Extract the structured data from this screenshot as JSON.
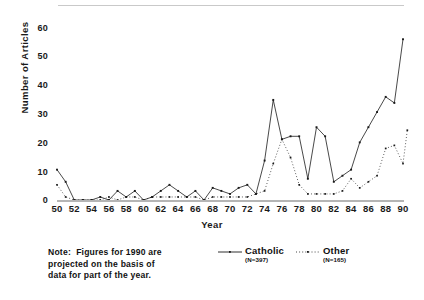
{
  "chart_data": {
    "type": "line",
    "title": "",
    "xlabel": "Year",
    "ylabel": "Number of Articles",
    "xlim": [
      50,
      90
    ],
    "ylim": [
      0,
      60
    ],
    "grid": false,
    "legend_position": "below-plot-right",
    "x": [
      50,
      51,
      52,
      53,
      54,
      55,
      56,
      57,
      58,
      59,
      60,
      61,
      62,
      63,
      64,
      65,
      66,
      67,
      68,
      69,
      70,
      71,
      72,
      73,
      74,
      75,
      76,
      77,
      78,
      79,
      80,
      81,
      82,
      83,
      84,
      85,
      86,
      87,
      88,
      89,
      90
    ],
    "xtick_labels": [
      "50",
      "52",
      "54",
      "56",
      "58",
      "60",
      "62",
      "64",
      "66",
      "68",
      "70",
      "72",
      "74",
      "76",
      "78",
      "80",
      "82",
      "84",
      "86",
      "88",
      "90"
    ],
    "xtick_values": [
      50,
      52,
      54,
      56,
      58,
      60,
      62,
      64,
      66,
      68,
      70,
      72,
      74,
      76,
      78,
      80,
      82,
      84,
      86,
      88,
      90
    ],
    "ytick_labels": [
      "0",
      "10",
      "20",
      "30",
      "40",
      "50",
      "60"
    ],
    "ytick_values": [
      0,
      10,
      20,
      30,
      40,
      50,
      60
    ],
    "series": [
      {
        "name": "Catholic",
        "n_label": "(N=397)",
        "marker": "dot",
        "line_style": "solid",
        "color": "#1a1a1a",
        "values": [
          10,
          6,
          0,
          0,
          1,
          1,
          2,
          4,
          1,
          4,
          1,
          2,
          4,
          6,
          3,
          2,
          4,
          1,
          5,
          4,
          3,
          4,
          3,
          4,
          6,
          6,
          4,
          4,
          4,
          3,
          3,
          3,
          2,
          1,
          1,
          1,
          1,
          1,
          1,
          1,
          1
        ]
      },
      {
        "name": "Other",
        "n_label": "(N=165)",
        "marker": "dot",
        "line_style": "dotted",
        "color": "#1a1a1a",
        "values": [
          5,
          1,
          0,
          0,
          0,
          1,
          0,
          1,
          0,
          1,
          0,
          1,
          1,
          1,
          1,
          1,
          1,
          1,
          1,
          1,
          1,
          1,
          1,
          1,
          2,
          12,
          20,
          15,
          2,
          2,
          2,
          2,
          2,
          3,
          3,
          5,
          7,
          9,
          10,
          6,
          11
        ]
      }
    ],
    "catholic_values": [
      10,
      6,
      0,
      0,
      1,
      1,
      2,
      4,
      1,
      4,
      1,
      2,
      4,
      6,
      3,
      2,
      4,
      1,
      5,
      4,
      3,
      4,
      3,
      4,
      6,
      33,
      20,
      21,
      9,
      4,
      12,
      11,
      4,
      5,
      5,
      10,
      15,
      17,
      18,
      16,
      27
    ],
    "other_values": [
      5,
      1,
      0,
      0,
      0,
      1,
      0,
      1,
      0,
      1,
      0,
      1,
      1,
      1,
      1,
      1,
      1,
      1,
      1,
      1,
      1,
      1,
      1,
      1,
      2,
      12,
      20,
      15,
      2,
      2,
      2,
      2,
      2,
      3,
      3,
      5,
      7,
      9,
      10,
      6,
      11
    ]
  },
  "series_points": {
    "catholic": [
      {
        "year": 50,
        "value": 10
      },
      {
        "year": 51,
        "value": 6
      },
      {
        "year": 52,
        "value": 0
      },
      {
        "year": 53,
        "value": 0
      },
      {
        "year": 54,
        "value": 0
      },
      {
        "year": 55,
        "value": 1
      },
      {
        "year": 56,
        "value": 0
      },
      {
        "year": 57,
        "value": 3
      },
      {
        "year": 58,
        "value": 1
      },
      {
        "year": 59,
        "value": 3
      },
      {
        "year": 60,
        "value": 0
      },
      {
        "year": 61,
        "value": 1
      },
      {
        "year": 62,
        "value": 3
      },
      {
        "year": 63,
        "value": 5
      },
      {
        "year": 64,
        "value": 3
      },
      {
        "year": 65,
        "value": 1
      },
      {
        "year": 66,
        "value": 3
      },
      {
        "year": 67,
        "value": 0
      },
      {
        "year": 68,
        "value": 4
      },
      {
        "year": 69,
        "value": 3
      },
      {
        "year": 70,
        "value": 2
      },
      {
        "year": 71,
        "value": 4
      },
      {
        "year": 72,
        "value": 5
      },
      {
        "year": 73,
        "value": 2
      },
      {
        "year": 74,
        "value": 13
      },
      {
        "year": 75,
        "value": 33
      },
      {
        "year": 76,
        "value": 20
      },
      {
        "year": 77,
        "value": 21
      },
      {
        "year": 78,
        "value": 21
      },
      {
        "year": 79,
        "value": 7
      },
      {
        "year": 80,
        "value": 24
      },
      {
        "year": 81,
        "value": 21
      },
      {
        "year": 82,
        "value": 6
      },
      {
        "year": 83,
        "value": 8
      },
      {
        "year": 84,
        "value": 10
      },
      {
        "year": 85,
        "value": 19
      },
      {
        "year": 86,
        "value": 24
      },
      {
        "year": 87,
        "value": 29
      },
      {
        "year": 88,
        "value": 34
      },
      {
        "year": 89,
        "value": 32
      },
      {
        "year": 90,
        "value": 53
      }
    ],
    "other": [
      {
        "year": 50,
        "value": 5
      },
      {
        "year": 51,
        "value": 1
      },
      {
        "year": 52,
        "value": 0
      },
      {
        "year": 53,
        "value": 0
      },
      {
        "year": 54,
        "value": 0
      },
      {
        "year": 55,
        "value": 0
      },
      {
        "year": 56,
        "value": 1
      },
      {
        "year": 57,
        "value": 0
      },
      {
        "year": 58,
        "value": 1
      },
      {
        "year": 59,
        "value": 1
      },
      {
        "year": 60,
        "value": 0
      },
      {
        "year": 61,
        "value": 1
      },
      {
        "year": 62,
        "value": 1
      },
      {
        "year": 63,
        "value": 1
      },
      {
        "year": 64,
        "value": 1
      },
      {
        "year": 65,
        "value": 1
      },
      {
        "year": 66,
        "value": 1
      },
      {
        "year": 67,
        "value": 0
      },
      {
        "year": 68,
        "value": 1
      },
      {
        "year": 69,
        "value": 1
      },
      {
        "year": 70,
        "value": 1
      },
      {
        "year": 71,
        "value": 1
      },
      {
        "year": 72,
        "value": 1
      },
      {
        "year": 73,
        "value": 2
      },
      {
        "year": 74,
        "value": 3
      },
      {
        "year": 75,
        "value": 12
      },
      {
        "year": 76,
        "value": 20
      },
      {
        "year": 77,
        "value": 14
      },
      {
        "year": 78,
        "value": 5
      },
      {
        "year": 79,
        "value": 2
      },
      {
        "year": 80,
        "value": 2
      },
      {
        "year": 81,
        "value": 2
      },
      {
        "year": 82,
        "value": 2
      },
      {
        "year": 83,
        "value": 3
      },
      {
        "year": 84,
        "value": 7
      },
      {
        "year": 85,
        "value": 4
      },
      {
        "year": 86,
        "value": 6
      },
      {
        "year": 87,
        "value": 8
      },
      {
        "year": 88,
        "value": 17
      },
      {
        "year": 89,
        "value": 18
      },
      {
        "year": 90,
        "value": 12
      },
      {
        "year": 90.5,
        "value": 23
      }
    ]
  },
  "axes": {
    "ylabel": "Number of Articles",
    "xlabel": "Year",
    "yticks": [
      "60",
      "50",
      "40",
      "30",
      "20",
      "10",
      "0"
    ],
    "xticks": [
      "50",
      "52",
      "54",
      "56",
      "58",
      "60",
      "62",
      "64",
      "66",
      "68",
      "70",
      "72",
      "74",
      "76",
      "78",
      "80",
      "82",
      "84",
      "86",
      "88",
      "90"
    ]
  },
  "legend": {
    "catholic": {
      "label": "Catholic",
      "n": "(N=397)"
    },
    "other": {
      "label": "Other",
      "n": "(N=165)"
    }
  },
  "note": {
    "line1": "Note:  Figures for 1990 are",
    "line2": "projected on the basis of",
    "line3": "data for part of the year."
  },
  "colors": {
    "ink": "#1a1a1a",
    "axis": "#b5b5b5",
    "rule": "#c9c9c9",
    "background": "#ffffff"
  }
}
